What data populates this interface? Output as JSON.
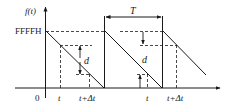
{
  "diagram": {
    "type": "sawtooth-timing",
    "y_axis_label": "f(t)",
    "y_level_label": "FFFFH",
    "origin_label": "0",
    "period_label": "T",
    "difference_label": "d",
    "x_tick_labels": [
      "t",
      "t+Δt",
      "t",
      "t+Δt"
    ],
    "colors": {
      "line": "#1a1a1a",
      "background": "#ffffff"
    }
  }
}
